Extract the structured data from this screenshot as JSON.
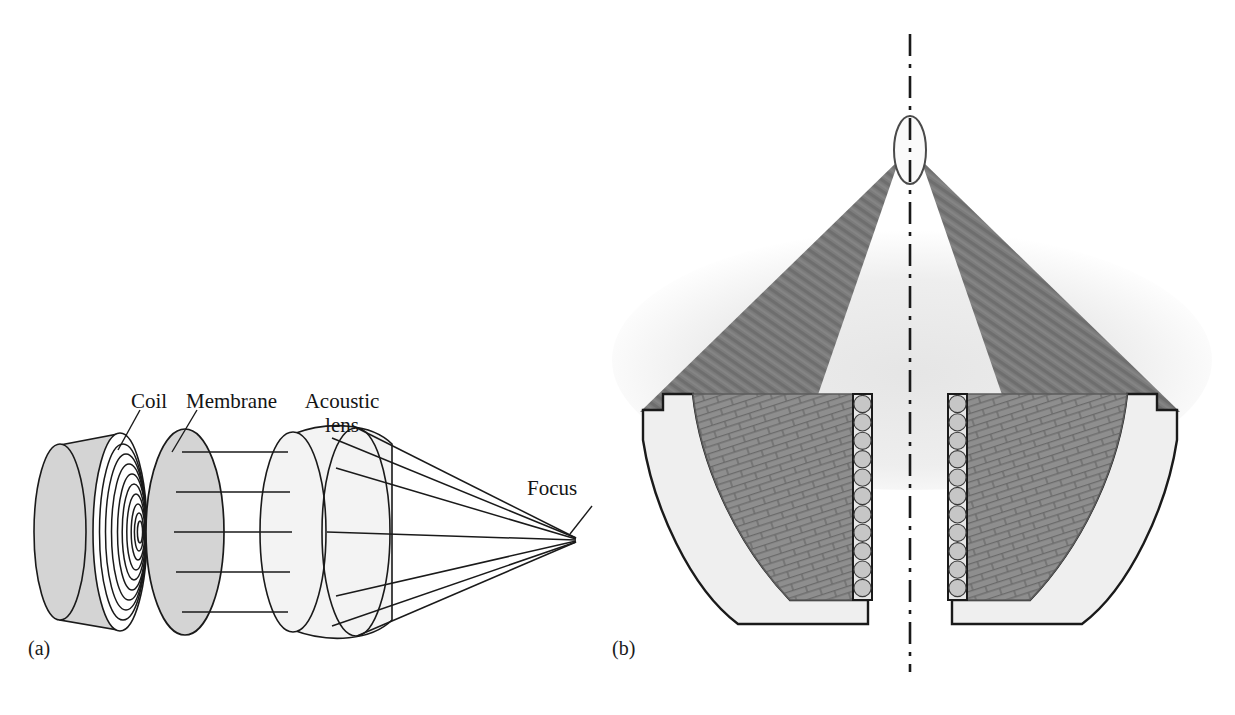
{
  "figure": {
    "type": "scientific-diagram",
    "background_color": "#ffffff",
    "width": 1235,
    "height": 715
  },
  "panels": [
    {
      "id": "a",
      "label": "(a)",
      "title": "Exploded view of focused transducer with acoustic lens",
      "labels": [
        {
          "key": "coil",
          "text": "Coil",
          "x": 131,
          "y": 390
        },
        {
          "key": "membrane",
          "text": "Membrane",
          "x": 186,
          "y": 390
        },
        {
          "key": "lens",
          "text": "Acoustic\nlens",
          "x": 300,
          "y": 390
        },
        {
          "key": "focus",
          "text": "Focus",
          "x": 527,
          "y": 477
        }
      ],
      "components": {
        "coil_disc": {
          "name": "spiral coil disc",
          "fill": "#d4d4d4",
          "stroke": "#1a1a1a"
        },
        "membrane_disc": {
          "name": "membrane disc",
          "fill": "#d4d4d4",
          "stroke": "#1a1a1a"
        },
        "acoustic_lens": {
          "name": "acoustic lens",
          "fill": "#f2f2f2",
          "stroke": "#1a1a1a"
        },
        "focus_point": {
          "name": "focal point",
          "x": 576,
          "y": 540
        }
      },
      "coil_turn_count": 9,
      "ray_count": 5
    },
    {
      "id": "b",
      "label": "(b)",
      "title": "Cross-section of concave transducer array with converging beam",
      "components": {
        "housing": {
          "name": "transducer housing",
          "fill": "#efefef",
          "stroke": "#1a1a1a"
        },
        "array_elements": {
          "name": "piezo element stack",
          "fill": "#8c8c8c",
          "stroke": "#5a5a5a"
        },
        "backing_circles": {
          "name": "matching layer beads",
          "fill": "#c6c6c6",
          "stroke": "#3a3a3a",
          "count": 11
        },
        "beam": {
          "name": "converging acoustic beam",
          "fill": "#7c7c7c"
        },
        "beam_halo": {
          "name": "beam halo",
          "fill": "#ededed"
        },
        "focal_spot": {
          "name": "focal spot ellipse",
          "fill": "#fafafa",
          "stroke": "#4a4a4a",
          "cx": 910,
          "cy": 150,
          "rx": 16,
          "ry": 34
        },
        "axis": {
          "name": "symmetry axis",
          "style": "dash-dot",
          "x": 910,
          "y_top": 34,
          "y_bottom": 672,
          "stroke": "#1a1a1a"
        }
      }
    }
  ],
  "colors": {
    "ink": "#1a1a1a",
    "disc_gray": "#d4d4d4",
    "lens_gray": "#f3f3f3",
    "beam_gray": "#7c7c7c",
    "element_gray": "#8c8c8c",
    "housing_gray": "#efefef",
    "halo_gray": "#ededed",
    "bead_gray": "#c6c6c6"
  }
}
